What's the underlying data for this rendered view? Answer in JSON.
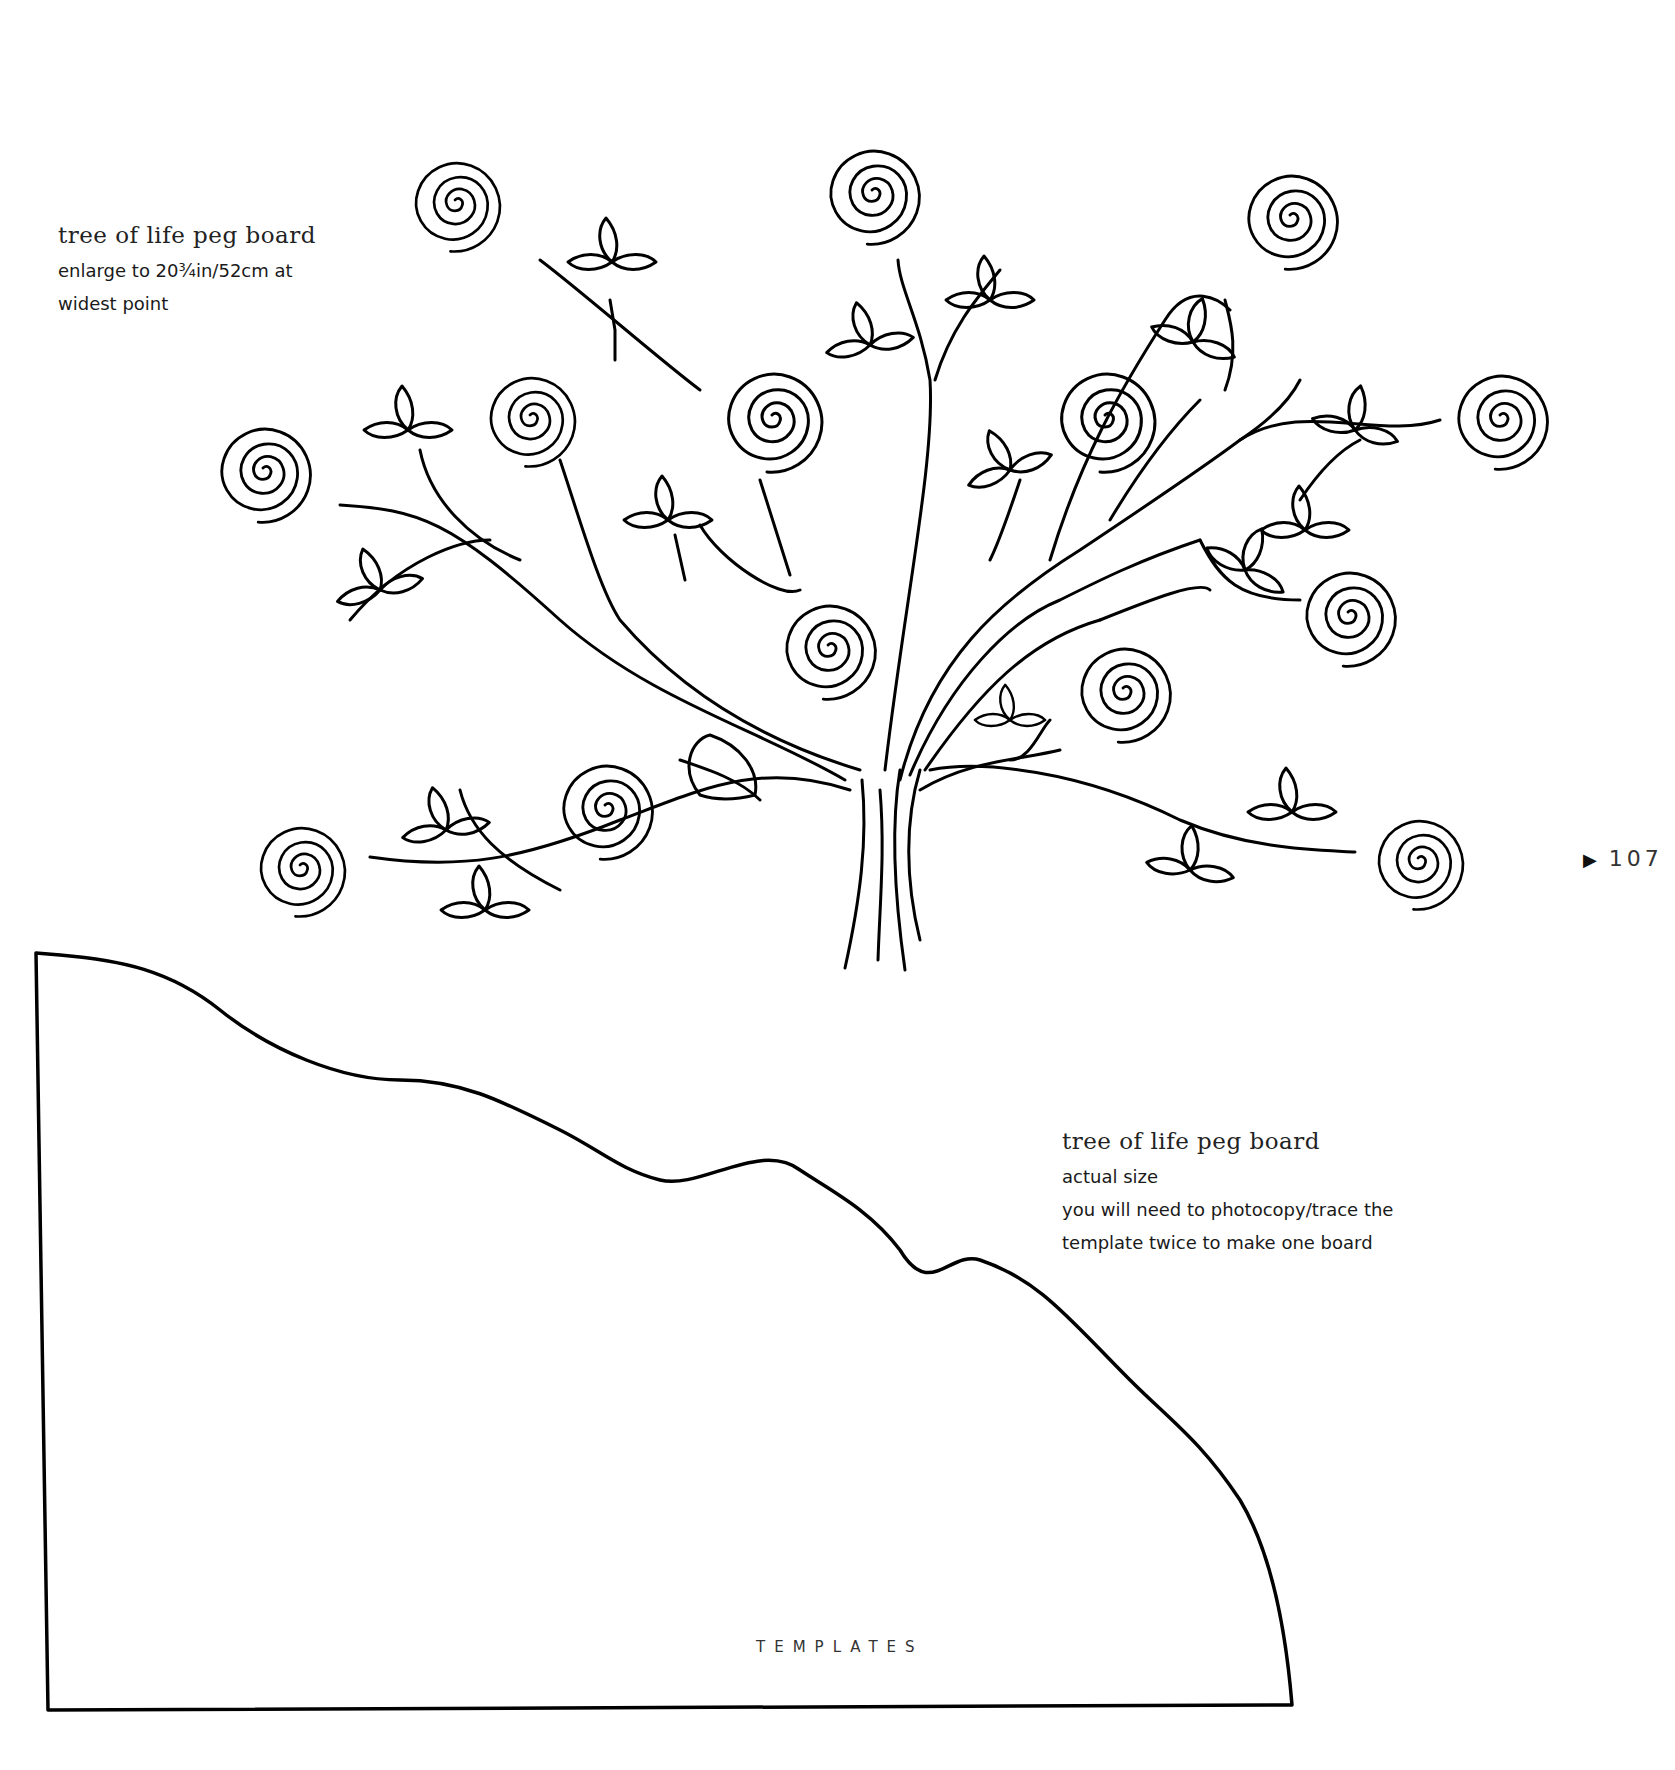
{
  "page": {
    "number": "107",
    "number_marker_icon": "triangle-right-icon",
    "footer": "TEMPLATES"
  },
  "captions": [
    {
      "title": "tree of life peg board",
      "lines": [
        "enlarge to 20¾in/52cm at",
        "widest point"
      ]
    },
    {
      "title": "tree of life peg board",
      "lines": [
        "actual size",
        "you will need to photocopy/trace the",
        "template twice to make one board"
      ]
    }
  ],
  "figures": {
    "tree": {
      "description": "tree-of-life line drawing with spiral flowers and leaf clusters",
      "spiral_count": 15
    },
    "board_outline": {
      "description": "peg board template outline with wavy hill top edge"
    }
  },
  "colors": {
    "ink": "#000000",
    "paper": "#ffffff"
  }
}
